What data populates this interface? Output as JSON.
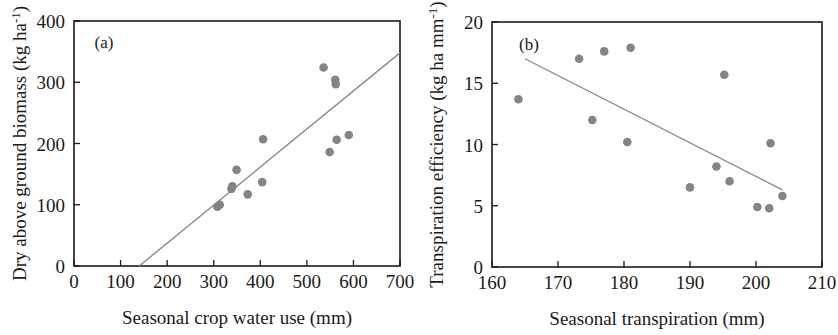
{
  "figure": {
    "background": "#ffffff",
    "marker_color": "#848484",
    "line_color": "#8a8a8a",
    "axis_color": "#1a1a1a"
  },
  "chart_data": [
    {
      "type": "scatter",
      "panel_tag": "(a)",
      "title": "",
      "xlabel": "Seasonal crop water use (mm)",
      "ylabel_main": "Dry above ground biomass (kg ha",
      "ylabel_sup": "-1",
      "ylabel_close": ")",
      "ylabel_full": "Dry above ground biomass (kg ha-1)",
      "xlim": [
        0,
        700
      ],
      "ylim": [
        0,
        400
      ],
      "xticks": [
        0,
        100,
        200,
        300,
        400,
        500,
        600,
        700
      ],
      "xtick_labels": [
        "0",
        "100",
        "200",
        "300",
        "400",
        "500",
        "600",
        "700"
      ],
      "yticks": [
        0,
        100,
        200,
        300,
        400
      ],
      "ytick_labels": [
        "0",
        "100",
        "200",
        "300",
        "400"
      ],
      "grid": false,
      "legend": "none",
      "points": [
        {
          "x": 308,
          "y": 97
        },
        {
          "x": 313,
          "y": 100
        },
        {
          "x": 338,
          "y": 126
        },
        {
          "x": 340,
          "y": 130
        },
        {
          "x": 349,
          "y": 157
        },
        {
          "x": 373,
          "y": 117
        },
        {
          "x": 404,
          "y": 137
        },
        {
          "x": 406,
          "y": 207
        },
        {
          "x": 536,
          "y": 324
        },
        {
          "x": 549,
          "y": 186
        },
        {
          "x": 561,
          "y": 304
        },
        {
          "x": 562,
          "y": 297
        },
        {
          "x": 564,
          "y": 206
        },
        {
          "x": 590,
          "y": 214
        }
      ],
      "fit_line": {
        "x1": 140,
        "y1": 0,
        "x2": 700,
        "y2": 348
      }
    },
    {
      "type": "scatter",
      "panel_tag": "(b)",
      "title": "",
      "xlabel": "Seasonal transpiration (mm)",
      "ylabel_main": "Transpiration efficiency (kg ha mm",
      "ylabel_sup": "-1",
      "ylabel_close": ")",
      "ylabel_full": "Transpiration efficiency (kg ha mm-1)",
      "xlim": [
        160,
        210
      ],
      "ylim": [
        0,
        20
      ],
      "xticks": [
        160,
        170,
        180,
        190,
        200,
        210
      ],
      "xtick_labels": [
        "160",
        "170",
        "180",
        "190",
        "200",
        "210"
      ],
      "yticks": [
        0,
        5,
        10,
        15,
        20
      ],
      "ytick_labels": [
        "0",
        "5",
        "10",
        "15",
        "20"
      ],
      "grid": false,
      "legend": "none",
      "points": [
        {
          "x": 164.0,
          "y": 13.7
        },
        {
          "x": 173.2,
          "y": 17.0
        },
        {
          "x": 175.2,
          "y": 12.0
        },
        {
          "x": 177.0,
          "y": 17.6
        },
        {
          "x": 180.5,
          "y": 10.2
        },
        {
          "x": 181.0,
          "y": 17.9
        },
        {
          "x": 190.0,
          "y": 6.5
        },
        {
          "x": 194.0,
          "y": 8.2
        },
        {
          "x": 195.2,
          "y": 15.7
        },
        {
          "x": 196.0,
          "y": 7.0
        },
        {
          "x": 200.2,
          "y": 4.9
        },
        {
          "x": 202.0,
          "y": 4.8
        },
        {
          "x": 202.2,
          "y": 10.1
        },
        {
          "x": 204.0,
          "y": 5.8
        }
      ],
      "fit_line": {
        "x1": 165.0,
        "y1": 17.0,
        "x2": 204.0,
        "y2": 6.3
      }
    }
  ]
}
